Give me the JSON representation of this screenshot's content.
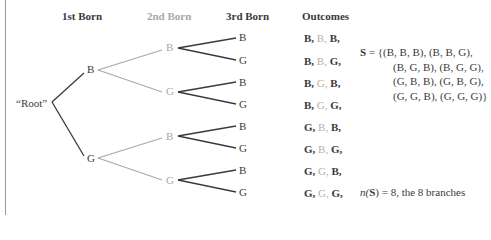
{
  "headers": {
    "first": "1st Born",
    "second": "2nd Born",
    "third": "3rd Born",
    "outcomes": "Outcomes"
  },
  "root_label": "“Root”",
  "level1": [
    {
      "label": "B"
    },
    {
      "label": "G"
    }
  ],
  "level2": [
    {
      "label": "B"
    },
    {
      "label": "G"
    },
    {
      "label": "B"
    },
    {
      "label": "G"
    }
  ],
  "level3": [
    {
      "label": "B"
    },
    {
      "label": "G"
    },
    {
      "label": "B"
    },
    {
      "label": "G"
    },
    {
      "label": "B"
    },
    {
      "label": "G"
    },
    {
      "label": "B"
    },
    {
      "label": "G"
    }
  ],
  "outcomes": [
    {
      "first": "B,",
      "second": "B,",
      "third": "B,"
    },
    {
      "first": "B,",
      "second": "B,",
      "third": "G,"
    },
    {
      "first": "B,",
      "second": "G,",
      "third": "B,"
    },
    {
      "first": "B,",
      "second": "G,",
      "third": "G,"
    },
    {
      "first": "G,",
      "second": "B,",
      "third": "B,"
    },
    {
      "first": "G,",
      "second": "B,",
      "third": "G,"
    },
    {
      "first": "G,",
      "second": "G,",
      "third": "B,"
    },
    {
      "first": "G,",
      "second": "G,",
      "third": "G,"
    }
  ],
  "sample_space": {
    "symbol": "S",
    "equals": " = ",
    "lines": [
      "{(B, B, B), (B, B, G),",
      "(B, G, B), (B, G, G),",
      "(G, B, B), (G, B, G),",
      "(G, G, B), (G, G, G)}"
    ]
  },
  "count": {
    "prefix": "n(",
    "symbol": "S",
    "suffix": ") =  8, the 8 branches"
  },
  "colors": {
    "dark": "#3a3a3a",
    "gray": "#a8a8a8",
    "rule": "#9a9a9a"
  }
}
